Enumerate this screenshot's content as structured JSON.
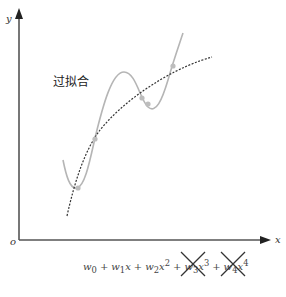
{
  "diagram": {
    "title_label": "过拟合",
    "axes": {
      "x_label": "x",
      "y_label": "y",
      "origin_label": "o"
    },
    "curves": [
      {
        "name": "overfit-polynomial",
        "style": "solid",
        "color": "#b5b5b5"
      },
      {
        "name": "true-trend",
        "style": "dashed",
        "color": "#333333"
      }
    ],
    "data_points_count": 5,
    "formula": {
      "terms": [
        {
          "coef": "w",
          "sub": "0",
          "var": "",
          "pow": "",
          "crossed": false
        },
        {
          "coef": "w",
          "sub": "1",
          "var": "x",
          "pow": "",
          "crossed": false
        },
        {
          "coef": "w",
          "sub": "2",
          "var": "x",
          "pow": "2",
          "crossed": false
        },
        {
          "coef": "w",
          "sub": "3",
          "var": "x",
          "pow": "3",
          "crossed": true
        },
        {
          "coef": "w",
          "sub": "4",
          "var": "x",
          "pow": "4",
          "crossed": true
        }
      ],
      "operator": "+"
    }
  }
}
